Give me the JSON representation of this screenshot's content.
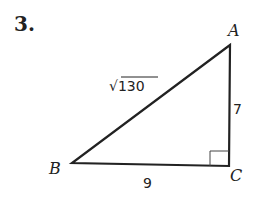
{
  "problem_number": "3.",
  "triangle": {
    "vertices": {
      "A": "A",
      "B": "B",
      "C": "C"
    },
    "right_angle_at": "C",
    "sides": {
      "AB": "√130",
      "AC": "7",
      "BC": "9"
    }
  }
}
